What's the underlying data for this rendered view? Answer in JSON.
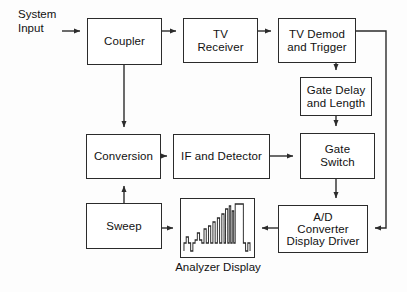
{
  "diagram": {
    "background_color": "#fdfdfd",
    "line_color": "#2b2b2b",
    "box_fill": "#ffffff",
    "labels": {
      "system_input": "System\nInput",
      "analyzer_display_caption": "Analyzer Display"
    },
    "blocks": [
      {
        "id": "coupler",
        "label": "Coupler",
        "x": 87,
        "y": 18,
        "w": 75,
        "h": 47
      },
      {
        "id": "tv_receiver",
        "label": "TV\nReceiver",
        "x": 183,
        "y": 18,
        "w": 75,
        "h": 45
      },
      {
        "id": "tv_demod",
        "label": "TV Demod\nand Trigger",
        "x": 278,
        "y": 18,
        "w": 78,
        "h": 45
      },
      {
        "id": "gate_delay",
        "label": "Gate Delay\nand Length",
        "x": 300,
        "y": 77,
        "w": 72,
        "h": 39
      },
      {
        "id": "conversion",
        "label": "Conversion",
        "x": 86,
        "y": 134,
        "w": 75,
        "h": 45
      },
      {
        "id": "if_detector",
        "label": "IF and Detector",
        "x": 173,
        "y": 134,
        "w": 97,
        "h": 45
      },
      {
        "id": "gate_switch",
        "label": "Gate\nSwitch",
        "x": 300,
        "y": 133,
        "w": 75,
        "h": 46
      },
      {
        "id": "sweep",
        "label": "Sweep",
        "x": 86,
        "y": 203,
        "w": 76,
        "h": 46
      },
      {
        "id": "ad_converter",
        "label": "A/D\nConverter\nDisplay Driver",
        "x": 278,
        "y": 205,
        "w": 90,
        "h": 48
      },
      {
        "id": "display",
        "label": "",
        "x": 180,
        "y": 198,
        "w": 75,
        "h": 60
      }
    ],
    "connections": [
      {
        "from": "system-input",
        "to": "coupler",
        "arrow": true
      },
      {
        "from": "coupler",
        "to": "tv-receiver",
        "arrow": true
      },
      {
        "from": "tv-receiver",
        "to": "tv-demod",
        "arrow": true
      },
      {
        "from": "coupler",
        "to": "conversion",
        "arrow": true
      },
      {
        "from": "tv-demod",
        "to": "gate-delay",
        "arrow": true
      },
      {
        "from": "gate-delay",
        "to": "gate-switch",
        "arrow": true
      },
      {
        "from": "conversion",
        "to": "if-detector",
        "arrow": true
      },
      {
        "from": "if-detector",
        "to": "gate-switch",
        "arrow": true
      },
      {
        "from": "gate-switch",
        "to": "ad-converter",
        "arrow": true
      },
      {
        "from": "sweep",
        "to": "conversion",
        "arrow": true
      },
      {
        "from": "sweep",
        "to": "display",
        "arrow": true
      },
      {
        "from": "ad-converter",
        "to": "display",
        "arrow": true
      },
      {
        "from": "tv-demod",
        "to": "ad-converter",
        "arrow": true
      }
    ],
    "waveform": {
      "description": "ascending staircase of narrow pulses rising left to right, two tall narrow spikes, one wide tall plateau, then a drop to a low notch at the right",
      "baseline_y": 44,
      "points": "4,52 4,44 7,44 7,38 10,38 10,44 13,44 13,52 16,52 16,44 19,44 19,41 22,41 22,34 25,34 25,41 28,41 28,44 31,44 31,30 34,30 34,44 37,44 37,27 40,27 40,44 43,44 43,23 46,23 46,44 49,44 49,19 52,19 52,44 55,44 55,15 58,15 58,44 60,44 60,10 63,10 63,44 65,44 65,7 67,7 67,44 69,44 69,12 71,12 71,44 73,44 73,5 84,5 84,44 87,44 87,52 90,52 90,44 93,44 93,52"
    }
  }
}
